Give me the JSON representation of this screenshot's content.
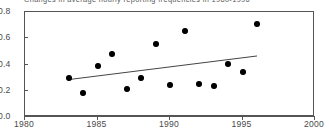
{
  "chart_data": {
    "type": "scatter",
    "title": "Changes in average hourly reporting frequencies in 1980-1996",
    "xlabel": "",
    "ylabel": "",
    "xlim": [
      1980,
      2000
    ],
    "ylim": [
      0.0,
      0.8
    ],
    "grid": false,
    "legend": null,
    "x_ticks": [
      "1980",
      "1985",
      "1990",
      "1995",
      "2000"
    ],
    "x_tick_values": [
      1980,
      1985,
      1990,
      1995,
      2000
    ],
    "y_ticks": [
      "0.0",
      "0.2",
      "0.4",
      "0.6",
      "0.8"
    ],
    "y_tick_values": [
      0.0,
      0.2,
      0.4,
      0.6,
      0.8
    ],
    "x": [
      1983,
      1984,
      1985,
      1986,
      1987,
      1988,
      1989,
      1990,
      1991,
      1992,
      1993,
      1994,
      1995,
      1996
    ],
    "values": [
      0.3,
      0.185,
      0.385,
      0.48,
      0.215,
      0.295,
      0.555,
      0.245,
      0.655,
      0.25,
      0.24,
      0.405,
      0.34,
      0.71
    ],
    "series": [
      {
        "name": "observations",
        "marker": "filled-diamond",
        "color": "#000000",
        "points": [
          {
            "x": 1983,
            "y": 0.3
          },
          {
            "x": 1984,
            "y": 0.185
          },
          {
            "x": 1985,
            "y": 0.385
          },
          {
            "x": 1986,
            "y": 0.48
          },
          {
            "x": 1987,
            "y": 0.215
          },
          {
            "x": 1988,
            "y": 0.295
          },
          {
            "x": 1989,
            "y": 0.555
          },
          {
            "x": 1990,
            "y": 0.245
          },
          {
            "x": 1991,
            "y": 0.655
          },
          {
            "x": 1992,
            "y": 0.25
          },
          {
            "x": 1993,
            "y": 0.24
          },
          {
            "x": 1994,
            "y": 0.405
          },
          {
            "x": 1995,
            "y": 0.34
          },
          {
            "x": 1996,
            "y": 0.71
          }
        ]
      },
      {
        "name": "trend-line",
        "type": "line",
        "color": "#444444",
        "points": [
          {
            "x": 1983.0,
            "y": 0.285
          },
          {
            "x": 1996.0,
            "y": 0.465
          }
        ]
      }
    ]
  }
}
